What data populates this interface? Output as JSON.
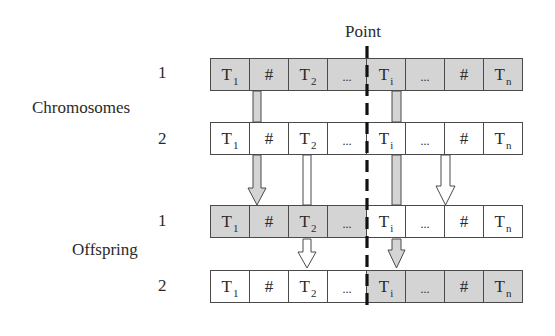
{
  "diagram": {
    "point_label": "Point",
    "groups": [
      {
        "label": "Chromosomes",
        "rows": [
          {
            "number": "1",
            "shade": "gray",
            "cells": [
              {
                "text": "T",
                "sub": "1",
                "shade": "gray"
              },
              {
                "text": "#",
                "sub": "",
                "shade": "gray"
              },
              {
                "text": "T",
                "sub": "2",
                "shade": "gray"
              },
              {
                "text": "...",
                "sub": "",
                "shade": "gray"
              },
              {
                "text": "T",
                "sub": "i",
                "shade": "gray"
              },
              {
                "text": "...",
                "sub": "",
                "shade": "gray"
              },
              {
                "text": "#",
                "sub": "",
                "shade": "gray"
              },
              {
                "text": "T",
                "sub": "n",
                "shade": "gray"
              }
            ]
          },
          {
            "number": "2",
            "shade": "white",
            "cells": [
              {
                "text": "T",
                "sub": "1",
                "shade": "white"
              },
              {
                "text": "#",
                "sub": "",
                "shade": "white"
              },
              {
                "text": "T",
                "sub": "2",
                "shade": "white"
              },
              {
                "text": "...",
                "sub": "",
                "shade": "white"
              },
              {
                "text": "T",
                "sub": "i",
                "shade": "white"
              },
              {
                "text": "...",
                "sub": "",
                "shade": "white"
              },
              {
                "text": "#",
                "sub": "",
                "shade": "white"
              },
              {
                "text": "T",
                "sub": "n",
                "shade": "white"
              }
            ]
          }
        ]
      },
      {
        "label": "Offspring",
        "rows": [
          {
            "number": "1",
            "shade": "mixed",
            "cells": [
              {
                "text": "T",
                "sub": "1",
                "shade": "gray"
              },
              {
                "text": "#",
                "sub": "",
                "shade": "gray"
              },
              {
                "text": "T",
                "sub": "2",
                "shade": "gray"
              },
              {
                "text": "...",
                "sub": "",
                "shade": "gray"
              },
              {
                "text": "T",
                "sub": "i",
                "shade": "white"
              },
              {
                "text": "...",
                "sub": "",
                "shade": "white"
              },
              {
                "text": "#",
                "sub": "",
                "shade": "white"
              },
              {
                "text": "T",
                "sub": "n",
                "shade": "white"
              }
            ]
          },
          {
            "number": "2",
            "shade": "mixed",
            "cells": [
              {
                "text": "T",
                "sub": "1",
                "shade": "white"
              },
              {
                "text": "#",
                "sub": "",
                "shade": "white"
              },
              {
                "text": "T",
                "sub": "2",
                "shade": "white"
              },
              {
                "text": "...",
                "sub": "",
                "shade": "white"
              },
              {
                "text": "T",
                "sub": "i",
                "shade": "gray"
              },
              {
                "text": "...",
                "sub": "",
                "shade": "gray"
              },
              {
                "text": "#",
                "sub": "",
                "shade": "gray"
              },
              {
                "text": "T",
                "sub": "n",
                "shade": "gray"
              }
            ]
          }
        ]
      }
    ],
    "colors": {
      "gray_fill": "#d4d4d4",
      "white_fill": "#ffffff",
      "border": "#4a4a4a",
      "cut_line": "#111111"
    },
    "arrows": [
      {
        "from": "chromosome-1",
        "to": "offspring-1",
        "fill": "gray",
        "column": "#"
      },
      {
        "from": "chromosome-1",
        "to": "offspring-2",
        "fill": "gray",
        "column": "T_i"
      },
      {
        "from": "chromosome-2",
        "to": "offspring-2",
        "fill": "white",
        "column": "T_2"
      },
      {
        "from": "chromosome-2",
        "to": "offspring-1",
        "fill": "white",
        "column": "..."
      }
    ]
  }
}
